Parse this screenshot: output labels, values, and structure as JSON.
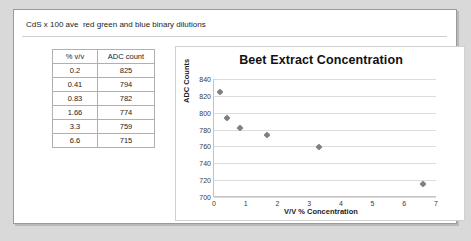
{
  "header": {
    "text": "CdS x 100 ave  red green and blue binary dilutions"
  },
  "table": {
    "columns": [
      "% v/v",
      "ADC count"
    ],
    "rows": [
      [
        "0.2",
        "825"
      ],
      [
        "0.41",
        "794"
      ],
      [
        "0.83",
        "782"
      ],
      [
        "1.66",
        "774"
      ],
      [
        "3.3",
        "759"
      ],
      [
        "6.6",
        "715"
      ]
    ]
  },
  "chart_data": {
    "type": "scatter",
    "title": "Beet Extract Concentration",
    "xlabel": "V/V % Concentration",
    "ylabel": "ADC Counts",
    "x": [
      0.2,
      0.41,
      0.83,
      1.66,
      3.3,
      6.6
    ],
    "values": [
      825,
      794,
      782,
      774,
      759,
      715
    ],
    "xlim": [
      0,
      7
    ],
    "ylim": [
      700,
      840
    ],
    "xticks": [
      "0",
      "1",
      "2",
      "3",
      "4",
      "5",
      "6",
      "7"
    ],
    "yticks": [
      "700",
      "720",
      "740",
      "760",
      "780",
      "800",
      "820",
      "840"
    ],
    "grid": true,
    "legend": false,
    "marker": "diamond",
    "marker_color": "#808080"
  }
}
